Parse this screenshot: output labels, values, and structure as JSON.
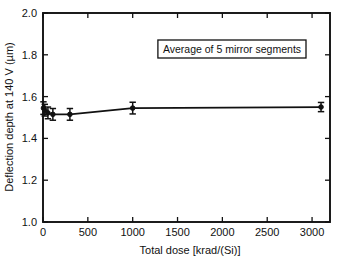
{
  "chart_data": {
    "type": "line",
    "title": "",
    "xlabel": "Total dose [krad/(Si)]",
    "ylabel": "Deflection depth at 140 V (µm)",
    "xlim": [
      0,
      3200
    ],
    "ylim": [
      1.0,
      2.0
    ],
    "xticks": [
      0,
      500,
      1000,
      1500,
      2000,
      2500,
      3000
    ],
    "xticklabels": [
      "0",
      "500",
      "1000",
      "1500",
      "2000",
      "2500",
      "3000"
    ],
    "yticks": [
      1.0,
      1.2,
      1.4,
      1.6,
      1.8,
      2.0
    ],
    "yticklabels": [
      "1.0",
      "1.2",
      "1.4",
      "1.6",
      "1.8",
      "2.0"
    ],
    "grid": false,
    "legend_position": "upper-center",
    "annotations": [
      {
        "text": "Average of 5 mirror segments",
        "boxed": true
      }
    ],
    "series": [
      {
        "name": "Deflection depth",
        "marker": "filled-circle",
        "line": "solid",
        "color": "#111111",
        "x": [
          5,
          20,
          55,
          110,
          300,
          1000,
          3100
        ],
        "y": [
          1.545,
          1.535,
          1.522,
          1.515,
          1.515,
          1.545,
          1.55
        ],
        "yerr": [
          0.03,
          0.028,
          0.028,
          0.028,
          0.028,
          0.028,
          0.022
        ]
      }
    ]
  },
  "figure": {
    "xlabel": "Total dose [krad/(Si)]",
    "ylabel": "Deflection depth at 140 V (µm)",
    "legend_text": "Average of 5 mirror segments"
  }
}
